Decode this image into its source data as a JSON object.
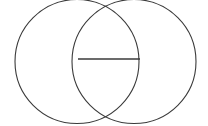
{
  "figure": {
    "background_color": "#ffffff",
    "stroke_color": "#3a3a3a",
    "stroke_width": 1.1,
    "canvas": {
      "width": 208,
      "height": 126
    }
  },
  "chart_data": {
    "type": "diagram",
    "subtitle": "",
    "xlabel": "",
    "ylabel": "",
    "grid": false,
    "legend": null,
    "xlim": [
      0,
      208
    ],
    "ylim": [
      0,
      126
    ],
    "shapes": [
      {
        "name": "left-circle",
        "type": "circle",
        "cx": 77,
        "cy": 61.5,
        "r": 62,
        "fill": "none",
        "stroke": "#3a3a3a",
        "stroke_width": 1.1
      },
      {
        "name": "right-circle",
        "type": "circle",
        "cx": 134,
        "cy": 61.5,
        "r": 62,
        "fill": "none",
        "stroke": "#3a3a3a",
        "stroke_width": 1.1
      },
      {
        "name": "horizontal-chord",
        "type": "line",
        "x1": 78,
        "y1": 59,
        "x2": 140,
        "y2": 59,
        "stroke": "#3a3a3a",
        "stroke_width": 1.3
      }
    ],
    "annotations": [],
    "labels": []
  }
}
